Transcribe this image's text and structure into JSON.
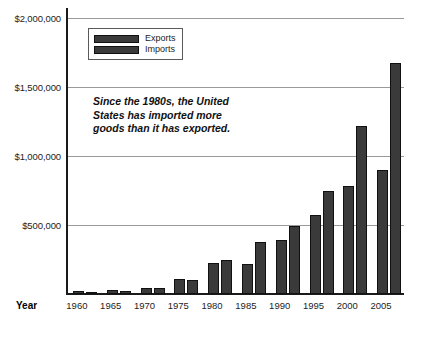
{
  "chart_data": {
    "type": "bar",
    "title": "",
    "subtitle": "",
    "xlabel": "Year",
    "ylabel": "",
    "categories": [
      "1960",
      "1965",
      "1970",
      "1975",
      "1980",
      "1985",
      "1990",
      "1995",
      "2000",
      "2005"
    ],
    "series": [
      {
        "name": "Exports",
        "values": [
          20000,
          27000,
          43000,
          108000,
          225000,
          219000,
          394000,
          575000,
          782000,
          901000
        ]
      },
      {
        "name": "Imports",
        "values": [
          15000,
          22000,
          40000,
          98000,
          245000,
          377000,
          495000,
          749000,
          1218000,
          1673000
        ]
      }
    ],
    "ylim": [
      0,
      2070000
    ],
    "y_ticks": [
      500000,
      1000000,
      1500000,
      2000000
    ],
    "y_tick_labels": [
      "$500,000",
      "$1,000,000",
      "$1,500,000",
      "$2,000,000"
    ],
    "grid": true,
    "legend_position": "top-left",
    "annotations": [
      "Since the 1980s, the United",
      "States has imported more",
      "goods than it has exported."
    ],
    "colors": {
      "bar_fill": "#3a3a3a",
      "bar_stroke": "#111111",
      "gridline": "#9a9a9a",
      "axis": "#1a1a1a",
      "text": "#1d1d1d",
      "background": "#ffffff"
    }
  },
  "legend": {
    "items": [
      {
        "label": "Exports"
      },
      {
        "label": "Imports"
      }
    ]
  },
  "axis": {
    "x_title": "Year"
  }
}
